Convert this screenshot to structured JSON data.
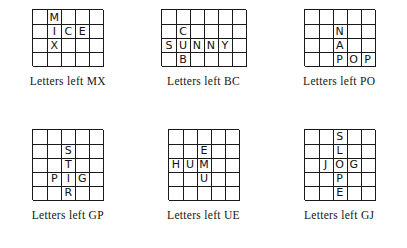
{
  "puzzles": [
    {
      "id": "puzzle-1",
      "cols": 5,
      "rows": 4,
      "cells": [
        "",
        "M",
        "",
        "",
        "",
        "",
        "I",
        "C",
        "E",
        "",
        "",
        "X",
        "",
        "",
        "",
        "",
        "",
        "",
        "",
        ""
      ],
      "caption": "Letters left MX"
    },
    {
      "id": "puzzle-2",
      "cols": 6,
      "rows": 4,
      "cells": [
        "",
        "",
        "",
        "",
        "",
        "",
        "",
        "C",
        "",
        "",
        "",
        "",
        "S",
        "U",
        "N",
        "N",
        "Y",
        "",
        "",
        "B",
        "",
        "",
        "",
        ""
      ],
      "caption": "Letters left BC"
    },
    {
      "id": "puzzle-3",
      "cols": 5,
      "rows": 4,
      "cells": [
        "",
        "",
        "",
        "",
        "",
        "",
        "",
        "N",
        "",
        "",
        "",
        "",
        "A",
        "",
        "",
        "",
        "",
        "P",
        "O",
        "P"
      ],
      "caption": "Letters left PO"
    },
    {
      "id": "puzzle-4",
      "cols": 5,
      "rows": 5,
      "cells": [
        "",
        "",
        "",
        "",
        "",
        "",
        "",
        "S",
        "",
        "",
        "",
        "",
        "T",
        "",
        "",
        "",
        "P",
        "I",
        "G",
        "",
        "",
        "",
        "R",
        "",
        ""
      ],
      "caption": "Letters left GP"
    },
    {
      "id": "puzzle-5",
      "cols": 5,
      "rows": 5,
      "cells": [
        "",
        "",
        "",
        "",
        "",
        "",
        "",
        "E",
        "",
        "",
        "H",
        "U",
        "M",
        "",
        "",
        "",
        "",
        "U",
        "",
        "",
        "",
        "",
        "",
        "",
        ""
      ],
      "caption": "Letters left UE"
    },
    {
      "id": "puzzle-6",
      "cols": 5,
      "rows": 5,
      "cells": [
        "",
        "",
        "S",
        "",
        "",
        "",
        "",
        "L",
        "",
        "",
        "",
        "J",
        "O",
        "G",
        "",
        "",
        "",
        "P",
        "",
        "",
        "",
        "",
        "E",
        "",
        ""
      ],
      "caption": "Letters left GJ"
    }
  ]
}
